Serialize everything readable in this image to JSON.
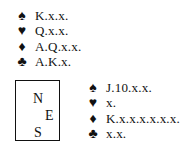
{
  "hands": {
    "north": [
      {
        "suit": "spades",
        "symbol": "♠",
        "cards": "K.x.x."
      },
      {
        "suit": "hearts",
        "symbol": "♥",
        "cards": "Q.x.x."
      },
      {
        "suit": "diamonds",
        "symbol": "♦",
        "cards": "A.Q.x.x."
      },
      {
        "suit": "clubs",
        "symbol": "♣",
        "cards": "A.K.x."
      }
    ],
    "east": [
      {
        "suit": "spades",
        "symbol": "♠",
        "cards": "J.10.x.x."
      },
      {
        "suit": "hearts",
        "symbol": "♥",
        "cards": "x."
      },
      {
        "suit": "diamonds",
        "symbol": "♦",
        "cards": "K.x.x.x.x.x.x."
      },
      {
        "suit": "clubs",
        "symbol": "♣",
        "cards": "x.x."
      }
    ]
  },
  "compass": {
    "north": "N",
    "east": "E",
    "south": "S"
  }
}
